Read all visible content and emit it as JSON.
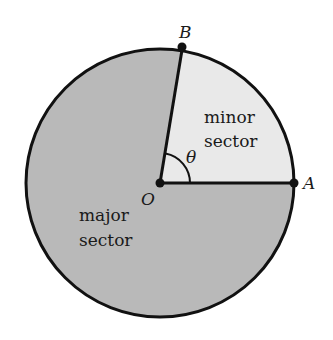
{
  "diagram": {
    "type": "circle-sectors",
    "colors": {
      "background": "#ffffff",
      "major_sector_fill": "#b9b9b9",
      "minor_sector_fill": "#e9e9e9",
      "stroke": "#111111"
    },
    "points": {
      "O": {
        "label": "O",
        "x": 160,
        "y": 183
      },
      "A": {
        "label": "A",
        "x": 294,
        "y": 183
      },
      "B": {
        "label": "B",
        "x": 182,
        "y": 47
      }
    },
    "radius": 134,
    "angle_label": "θ",
    "regions": {
      "minor": {
        "line1": "minor",
        "line2": "sector"
      },
      "major": {
        "line1": "major",
        "line2": "sector"
      }
    }
  }
}
